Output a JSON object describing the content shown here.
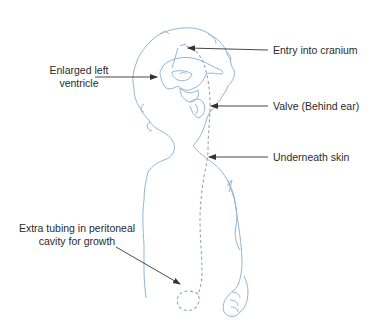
{
  "diagram": {
    "colors": {
      "outline": "#93b6d2",
      "shunt": "#8ea6bd",
      "arrow": "#333333",
      "text": "#2a2a2a",
      "background": "#ffffff"
    },
    "labels": {
      "entry": "Entry into cranium",
      "ventricle_line1": "Enlarged left",
      "ventricle_line2": "ventricle",
      "valve": "Valve (Behind ear)",
      "skin": "Underneath skin",
      "tubing_line1": "Extra tubing in peritoneal",
      "tubing_line2": "cavity for growth"
    }
  }
}
